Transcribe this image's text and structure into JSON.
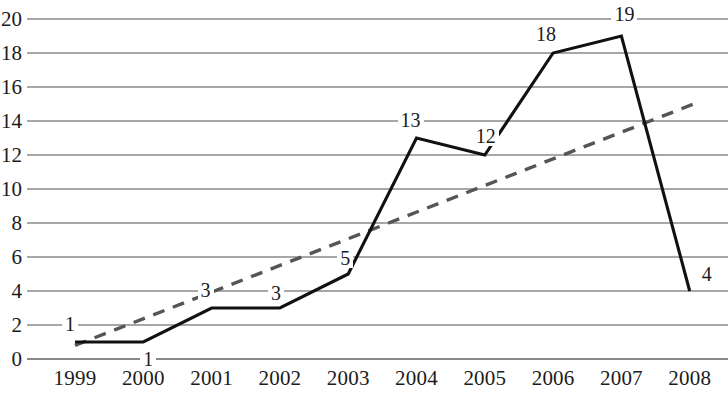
{
  "chart_data": {
    "type": "line",
    "title": "",
    "subtitle": "",
    "xlabel": "",
    "ylabel": "",
    "categories": [
      "1999",
      "2000",
      "2001",
      "2002",
      "2003",
      "2004",
      "2005",
      "2006",
      "2007",
      "2008"
    ],
    "values": [
      1,
      1,
      3,
      3,
      5,
      13,
      12,
      18,
      19,
      4
    ],
    "point_labels": [
      "1",
      "1",
      "3",
      "3",
      "5",
      "13",
      "12",
      "18",
      "19",
      "4"
    ],
    "series": [
      {
        "name": "data",
        "style": "solid",
        "color": "#111111",
        "values": [
          1,
          1,
          3,
          3,
          5,
          13,
          12,
          18,
          19,
          4
        ]
      },
      {
        "name": "trendline",
        "style": "dashed",
        "color": "#555555",
        "x": [
          "1999",
          "2008"
        ],
        "values": [
          0.8,
          15.0
        ]
      }
    ],
    "ylim": [
      0,
      20
    ],
    "ytick_step": 2,
    "ytick_labels": [
      "0",
      "2",
      "4",
      "6",
      "8",
      "10",
      "12",
      "14",
      "16",
      "18",
      "20"
    ],
    "grid": true,
    "grid_axis": "y",
    "grid_color": "#8a8a8a",
    "legend": "none",
    "legend_position": "none",
    "annotations": []
  },
  "axes": {
    "y_title": "",
    "x_title": ""
  }
}
